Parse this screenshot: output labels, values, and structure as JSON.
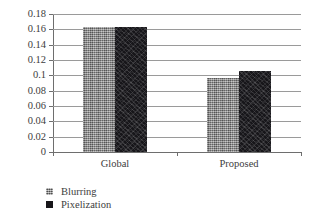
{
  "chart_data": {
    "type": "bar",
    "title": "",
    "xlabel": "",
    "ylabel": "",
    "categories": [
      "Global",
      "Proposed"
    ],
    "series": [
      {
        "name": "Blurring",
        "values": [
          0.1625,
          0.097
        ],
        "color": "#8d8d8d",
        "pattern": "cross-hatch"
      },
      {
        "name": "Pixelization",
        "values": [
          0.1625,
          0.1055
        ],
        "color": "#17161a",
        "pattern": "speckle"
      }
    ],
    "ylim": [
      0,
      0.18
    ],
    "ytick_values": [
      0,
      0.02,
      0.04,
      0.06,
      0.08,
      0.1,
      0.12,
      0.14,
      0.16,
      0.18
    ],
    "ytick_labels": [
      "0",
      "0.02",
      "0.04",
      "0.06",
      "0.08",
      "0.1",
      "0.12",
      "0.14",
      "0.16",
      "0.18"
    ],
    "grid": true,
    "grid_axis": "y",
    "legend_position": "bottom-left",
    "legend_entries": [
      "Blurring",
      "Pixelization"
    ]
  }
}
